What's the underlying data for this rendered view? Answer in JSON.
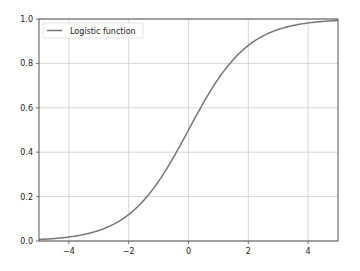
{
  "chart_data": {
    "type": "line",
    "title": "",
    "xlabel": "",
    "ylabel": "",
    "xlim": [
      -5,
      5
    ],
    "ylim": [
      0,
      1
    ],
    "grid": true,
    "legend_position": "upper left",
    "x_ticks": [
      "−4",
      "−2",
      "0",
      "2",
      "4"
    ],
    "x_tick_values": [
      -4,
      -2,
      0,
      2,
      4
    ],
    "y_ticks": [
      "0.0",
      "0.2",
      "0.4",
      "0.6",
      "0.8",
      "1.0"
    ],
    "y_tick_values": [
      0,
      0.2,
      0.4,
      0.6,
      0.8,
      1.0
    ],
    "series": [
      {
        "name": "Logistic function",
        "color": "#777777",
        "x": [
          -5,
          -4,
          -3,
          -2,
          -1,
          0,
          1,
          2,
          3,
          4,
          5
        ],
        "y": [
          0.0067,
          0.018,
          0.047,
          0.119,
          0.269,
          0.5,
          0.731,
          0.881,
          0.953,
          0.982,
          0.9933
        ]
      }
    ]
  }
}
